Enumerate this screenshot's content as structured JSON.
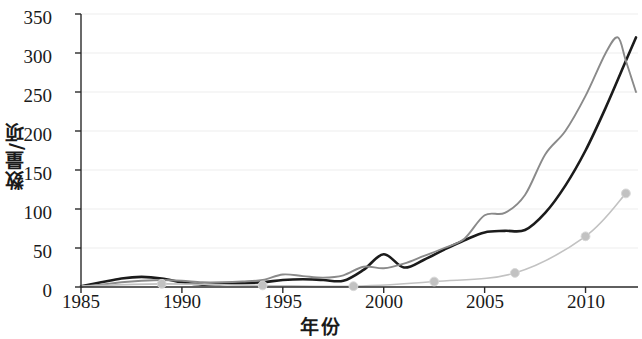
{
  "chart_data": {
    "type": "line",
    "title": "",
    "xlabel": "年份",
    "ylabel": "数量/项",
    "xlim": [
      1985,
      2012.6
    ],
    "ylim": [
      0,
      350
    ],
    "xticks": [
      1985,
      1990,
      1995,
      2000,
      2005,
      2010
    ],
    "yticks": [
      0,
      50,
      100,
      150,
      200,
      250,
      300,
      350
    ],
    "grid": "horizontal-faint",
    "legend": "none",
    "colors": {
      "series_dark": "#1b1b1b",
      "series_gray": "#8a8a8a",
      "series_light": "#c2c2c2",
      "axis": "#2a2a2a",
      "grid": "#ededed",
      "background": "#ffffff"
    },
    "series": [
      {
        "name": "series-dark",
        "color": "#1b1b1b",
        "marker": "none",
        "x": [
          1985,
          1986,
          1987,
          1988,
          1989,
          1990,
          1991,
          1992,
          1993,
          1994,
          1995,
          1996,
          1997,
          1998,
          1999,
          2000,
          2001,
          2002,
          2003,
          2004,
          2005,
          2006,
          2007,
          2008,
          2009,
          2010,
          2011,
          2012,
          2012.5
        ],
        "values": [
          1,
          6,
          11,
          13,
          11,
          6,
          3,
          4,
          5,
          6,
          9,
          10,
          9,
          8,
          22,
          42,
          25,
          35,
          48,
          60,
          70,
          72,
          73,
          95,
          130,
          175,
          230,
          290,
          320
        ]
      },
      {
        "name": "series-gray",
        "color": "#8a8a8a",
        "marker": "none",
        "x": [
          1985,
          1986,
          1987,
          1988,
          1989,
          1990,
          1991,
          1992,
          1993,
          1994,
          1995,
          1996,
          1997,
          1998,
          1999,
          2000,
          2001,
          2002,
          2003,
          2004,
          2005,
          2006,
          2007,
          2008,
          2009,
          2010,
          2011,
          2011.6,
          2012,
          2012.5
        ],
        "values": [
          1,
          3,
          6,
          8,
          9,
          8,
          6,
          6,
          7,
          9,
          16,
          14,
          12,
          15,
          26,
          24,
          30,
          40,
          50,
          62,
          92,
          95,
          118,
          170,
          200,
          245,
          300,
          320,
          290,
          250
        ]
      },
      {
        "name": "series-light-markers",
        "color": "#c2c2c2",
        "marker": "circle",
        "x": [
          1985,
          1989,
          1994,
          1998.5,
          2002.5,
          2006.5,
          2010,
          2012
        ],
        "values": [
          1,
          4,
          2,
          1,
          7,
          18,
          65,
          120
        ]
      }
    ]
  },
  "axis": {
    "y_tick_labels": [
      "350",
      "300",
      "250",
      "200",
      "150",
      "100",
      "50",
      "0"
    ],
    "x_tick_labels": [
      "1985",
      "1990",
      "1995",
      "2000",
      "2005",
      "2010"
    ]
  }
}
